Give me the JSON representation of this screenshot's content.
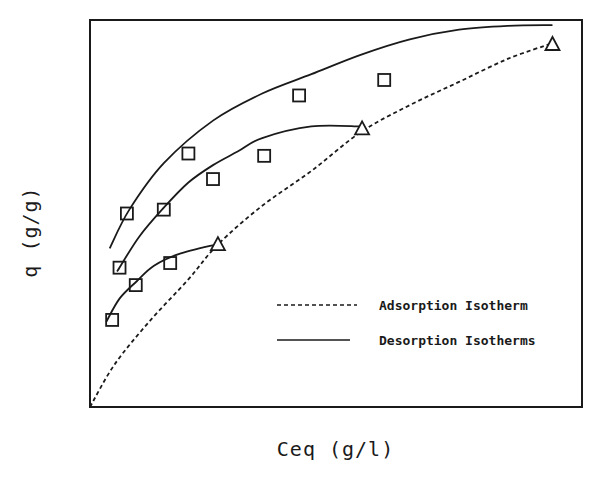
{
  "chart_data": {
    "type": "line",
    "title": "",
    "xlabel": "Ceq  (g/l)",
    "ylabel": "q  (g/g)",
    "xlim": [
      0,
      100
    ],
    "ylim": [
      0,
      100
    ],
    "grid": false,
    "ticks": "none",
    "legend_position": "lower right (inside plot)",
    "legend": [
      {
        "label": "Adsorption Isotherm",
        "style": "dashed"
      },
      {
        "label": "Desorption Isotherms",
        "style": "solid"
      }
    ],
    "series": [
      {
        "name": "Adsorption Isotherm",
        "style": "dashed",
        "curve": [
          [
            0,
            0
          ],
          [
            5,
            11
          ],
          [
            12,
            22
          ],
          [
            20,
            33
          ],
          [
            26,
            42
          ],
          [
            35,
            52
          ],
          [
            45,
            61
          ],
          [
            55,
            71
          ],
          [
            65,
            78
          ],
          [
            75,
            84
          ],
          [
            85,
            90
          ],
          [
            94,
            94
          ]
        ]
      },
      {
        "name": "Desorption Isotherm 1",
        "style": "solid",
        "curve": [
          [
            4,
            41
          ],
          [
            8,
            51
          ],
          [
            15,
            63
          ],
          [
            25,
            74
          ],
          [
            35,
            81
          ],
          [
            45,
            86
          ],
          [
            55,
            91
          ],
          [
            65,
            95
          ],
          [
            75,
            97.5
          ],
          [
            85,
            98.5
          ],
          [
            94,
            98.7
          ]
        ],
        "squares": [
          [
            7.5,
            50
          ],
          [
            20,
            65.5
          ],
          [
            42.5,
            80.5
          ],
          [
            59.8,
            84.5
          ]
        ],
        "triangle": [
          94,
          93.8
        ]
      },
      {
        "name": "Desorption Isotherm 2",
        "style": "solid",
        "curve": [
          [
            5.5,
            35
          ],
          [
            10,
            44
          ],
          [
            15,
            51.5
          ],
          [
            20,
            58
          ],
          [
            25,
            62.5
          ],
          [
            30,
            66
          ],
          [
            35,
            69.5
          ],
          [
            45,
            72.5
          ],
          [
            55,
            72.5
          ]
        ],
        "squares": [
          [
            6,
            36
          ],
          [
            15,
            51
          ],
          [
            25,
            58.9
          ],
          [
            35.4,
            64.9
          ]
        ],
        "triangle": [
          55.3,
          72
        ]
      },
      {
        "name": "Desorption Isotherm 3",
        "style": "solid",
        "curve": [
          [
            3.3,
            22
          ],
          [
            6,
            28
          ],
          [
            9.5,
            32.5
          ],
          [
            13,
            36.5
          ],
          [
            18,
            39.5
          ],
          [
            26,
            42.1
          ]
        ],
        "squares": [
          [
            4.5,
            22.5
          ],
          [
            9.3,
            31.5
          ],
          [
            16.3,
            37.2
          ]
        ],
        "triangle": [
          26,
          42.1
        ]
      }
    ]
  },
  "legend": {
    "adsorption_label": "Adsorption Isotherm",
    "desorption_label": "Desorption Isotherms"
  },
  "axes": {
    "xlabel": "Ceq  (g/l)",
    "ylabel": "q  (g/g)"
  },
  "colors": {
    "ink": "#1a1a1a",
    "background": "#ffffff"
  }
}
